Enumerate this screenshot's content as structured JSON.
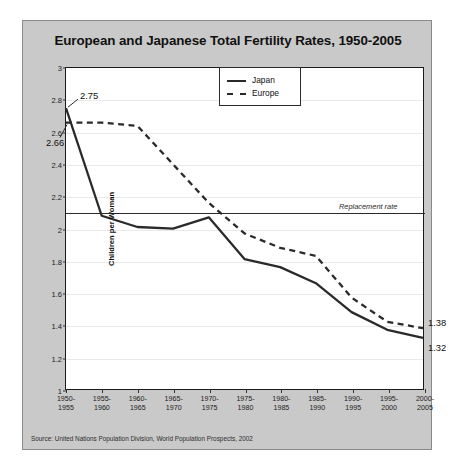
{
  "figure": {
    "title": "European and Japanese Total Fertility Rates, 1950-2005",
    "source": "Source: United Nations Population Division, World Population Prospects, 2002"
  },
  "legend": {
    "position": "inside-top-right",
    "items": [
      {
        "label": "Japan",
        "style": "solid"
      },
      {
        "label": "Europe",
        "style": "dashed"
      }
    ]
  },
  "annotations": {
    "replacement_rate": {
      "text": "Replacement rate",
      "value": 2.1
    },
    "japan_start": "2.75",
    "europe_start": "2.66",
    "europe_end": "1.38",
    "japan_end": "1.32"
  },
  "chart_data": {
    "type": "line",
    "title": "European and Japanese Total Fertility Rates, 1950-2005",
    "xlabel": "",
    "ylabel": "Children per Woman",
    "ylim": [
      1,
      3
    ],
    "ytick_step": 0.2,
    "yticks": [
      "1",
      "1.2",
      "1.4",
      "1.6",
      "1.8",
      "2",
      "2.2",
      "2.4",
      "2.6",
      "2.8",
      "3"
    ],
    "grid": true,
    "categories": [
      "1950-\n1955",
      "1955-\n1960",
      "1960-\n1965",
      "1965-\n1970",
      "1970-\n1975",
      "1975-\n1980",
      "1980-\n1985",
      "1985-\n1990",
      "1990-\n1995",
      "1995-\n2000",
      "2000-\n2005"
    ],
    "series": [
      {
        "name": "Japan",
        "style": "solid",
        "color": "#2a2a2a",
        "values": [
          2.75,
          2.08,
          2.01,
          2.0,
          2.07,
          1.81,
          1.76,
          1.66,
          1.48,
          1.37,
          1.32
        ]
      },
      {
        "name": "Europe",
        "style": "dashed",
        "color": "#2a2a2a",
        "values": [
          2.66,
          2.66,
          2.64,
          2.4,
          2.16,
          1.97,
          1.88,
          1.83,
          1.57,
          1.42,
          1.38
        ]
      }
    ],
    "reference_lines": [
      {
        "label": "Replacement rate",
        "y": 2.1
      }
    ]
  }
}
